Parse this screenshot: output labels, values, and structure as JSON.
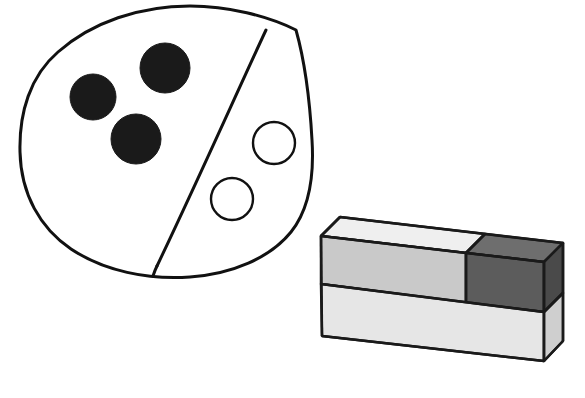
{
  "figure": {
    "title": "Hand-drawn oval partitioned into two regions with circles, beside a shaded 3D brick wall block",
    "background_color": "#ffffff",
    "ink_color": "#111111",
    "oval": {
      "name": "oval-outline",
      "description": "Large irregular hand-drawn closed oval occupying the upper-left of the image",
      "center": [
        160,
        140
      ],
      "radius_x": 142,
      "radius_y": 130,
      "stroke_color": "#111111",
      "stroke_width": 3,
      "fill_color": "#ffffff"
    },
    "divider": {
      "name": "oval-divider-line",
      "description": "Slightly curved chord splitting the oval into a left region and a right region",
      "start": [
        266,
        30
      ],
      "end": [
        157,
        265
      ],
      "stroke_color": "#111111",
      "stroke_width": 3
    },
    "left_region": {
      "label": "left-region",
      "filled_circle_count": 3,
      "circle_fill": "#1a1a1a"
    },
    "right_region": {
      "label": "right-region",
      "open_circle_count": 2,
      "circle_fill": "#ffffff",
      "circle_stroke": "#111111"
    },
    "circles": [
      {
        "name": "filled-circle-1",
        "cx": 93,
        "cy": 97,
        "r": 23,
        "fill": "#1a1a1a",
        "stroke": "#1a1a1a",
        "filled": true
      },
      {
        "name": "filled-circle-2",
        "cx": 165,
        "cy": 68,
        "r": 25,
        "fill": "#1a1a1a",
        "stroke": "#1a1a1a",
        "filled": true
      },
      {
        "name": "filled-circle-3",
        "cx": 136,
        "cy": 139,
        "r": 25,
        "fill": "#1a1a1a",
        "stroke": "#1a1a1a",
        "filled": true
      },
      {
        "name": "open-circle-1",
        "cx": 274,
        "cy": 143,
        "r": 21,
        "fill": "#ffffff",
        "stroke": "#111111",
        "filled": false
      },
      {
        "name": "open-circle-2",
        "cx": 232,
        "cy": 199,
        "r": 21,
        "fill": "#ffffff",
        "stroke": "#111111",
        "filled": false
      }
    ],
    "brick_block": {
      "name": "brick-block",
      "description": "Isometric rectangular block two bricks wide and two courses tall; the upper-right brick is shaded dark",
      "stroke_color": "#1a1a1a",
      "stroke_width": 2.5,
      "faces": {
        "top_light": "#efefef",
        "top_dark": "#6e6e6e",
        "front_upper_light": "#c9c9c9",
        "front_upper_dark": "#5c5c5c",
        "front_lower_light": "#e6e6e6",
        "side_upper_dark": "#4a4a4a",
        "side_lower_light": "#cfcfcf"
      },
      "geometry": {
        "front_top_left": [
          321,
          236
        ],
        "front_top_right": [
          540,
          262
        ],
        "front_bottom_left": [
          322,
          336
        ],
        "front_bottom_right": [
          540,
          361
        ],
        "back_top_left": [
          340,
          217
        ],
        "back_top_right": [
          563,
          243
        ],
        "back_bottom_right": [
          563,
          341
        ],
        "course_split_front_left": [
          321,
          283
        ],
        "course_split_front_right": [
          540,
          309
        ],
        "brick_split_front_top": [
          447,
          247
        ],
        "brick_split_front_bottom": [
          447,
          298
        ],
        "brick_split_top_face": [
          466,
          228
        ]
      }
    }
  }
}
